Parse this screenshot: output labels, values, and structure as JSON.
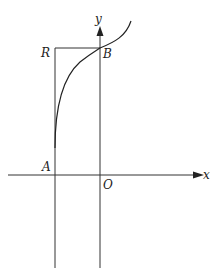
{
  "figure": {
    "labels": {
      "y_axis": "y",
      "x_axis": "x",
      "R": "R",
      "B": "B",
      "A": "A",
      "O": "O"
    },
    "colors": {
      "stroke": "#333333",
      "background": "#ffffff"
    }
  }
}
